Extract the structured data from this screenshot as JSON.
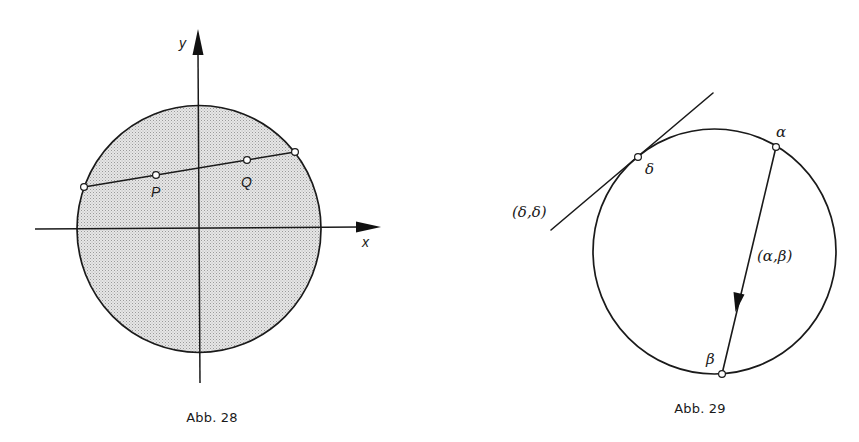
{
  "figures": [
    {
      "id": "abb28",
      "caption": "Abb. 28",
      "labels": {
        "y_axis": "y",
        "x_axis": "x",
        "point_p": "P",
        "point_q": "Q"
      },
      "colors": {
        "shade": "#d9d9d9",
        "ink": "#1a1a1a"
      }
    },
    {
      "id": "abb29",
      "caption": "Abb. 29",
      "labels": {
        "point_alpha": "α",
        "point_beta": "β",
        "point_delta": "δ",
        "tangent": "(δ,δ)",
        "chord": "(α,β)"
      },
      "colors": {
        "ink": "#1a1a1a"
      }
    }
  ]
}
